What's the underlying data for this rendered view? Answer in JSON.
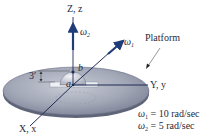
{
  "diagram": {
    "axes": {
      "z_label": "Z, z",
      "y_label": "Y, y",
      "x_label": "X, x"
    },
    "vectors": {
      "omega2_symbol": "ω",
      "omega2_sub": "2",
      "omega1_symbol": "ω",
      "omega1_sub": "1"
    },
    "points": {
      "a": "a",
      "b": "b"
    },
    "dimension": {
      "height_label": "3′"
    },
    "platform_label": "Platform",
    "givens": [
      {
        "symbol": "ω",
        "sub": "1",
        "text": " = 10 rad/sec"
      },
      {
        "symbol": "ω",
        "sub": "2",
        "text": " = 5 rad/sec"
      }
    ],
    "colors": {
      "disk_top": "#9ea3b2",
      "disk_edge": "#6b7186",
      "axis": "#1f2a55",
      "vector": "#1f3c7a",
      "text": "#2a2a3a"
    }
  }
}
